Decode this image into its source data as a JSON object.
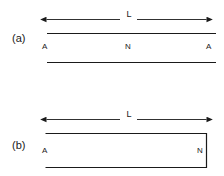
{
  "figure": {
    "background_color": "#ffffff",
    "stroke_color": "#1a1a1a",
    "width": 224,
    "height": 176
  },
  "panels": [
    {
      "id": "a",
      "label": "(a)",
      "dimension_label": "L",
      "node_labels": [
        "A",
        "N",
        "A"
      ],
      "shape": "two-parallel-horizontal-lines",
      "description": "open-open tube"
    },
    {
      "id": "b",
      "label": "(b)",
      "dimension_label": "L",
      "node_labels": [
        "A",
        "N"
      ],
      "shape": "rectangle-open-on-left",
      "description": "open-closed tube"
    }
  ]
}
